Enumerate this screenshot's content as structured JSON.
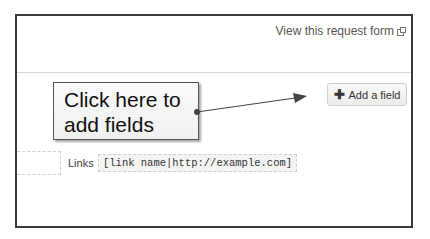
{
  "header": {
    "view_form_link": "View this request form",
    "view_form_icon": "external-window-icon"
  },
  "toolbar": {
    "add_field_label": "Add a field",
    "add_field_icon": "plus-icon"
  },
  "help": {
    "links_label": "Links",
    "links_syntax": "[link name|http://example.com]"
  },
  "annotation": {
    "callout_line1": "Click here to",
    "callout_line2": "add fields"
  },
  "colors": {
    "frame_border": "#3a3a3a",
    "link_text": "#555555",
    "arrow": "#444444"
  }
}
